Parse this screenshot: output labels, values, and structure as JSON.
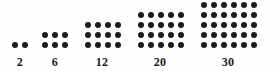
{
  "figure": {
    "background_color": "#fefefe",
    "dot_color": "#1c1c1c",
    "label_color": "#1c1c1c"
  },
  "chart_data": {
    "type": "diagram",
    "title": "",
    "subtitle": "",
    "xlabel": "",
    "ylabel": "",
    "categories": [
      "2",
      "6",
      "12",
      "20",
      "30"
    ],
    "values": [
      2,
      6,
      12,
      20,
      30
    ],
    "groups": [
      {
        "label": "2",
        "rows": 1,
        "cols": 2,
        "count": 2,
        "left": 10,
        "label_left": 8,
        "label_width": 24
      },
      {
        "label": "6",
        "rows": 2,
        "cols": 3,
        "count": 6,
        "left": 40,
        "label_left": 38,
        "label_width": 34
      },
      {
        "label": "12",
        "rows": 3,
        "cols": 4,
        "count": 12,
        "left": 83,
        "label_left": 80,
        "label_width": 44
      },
      {
        "label": "20",
        "rows": 4,
        "cols": 5,
        "count": 20,
        "left": 136,
        "label_left": 133,
        "label_width": 54
      },
      {
        "label": "30",
        "rows": 5,
        "cols": 6,
        "count": 30,
        "left": 199,
        "label_left": 196,
        "label_width": 64
      }
    ],
    "legend": [],
    "grid": false
  }
}
